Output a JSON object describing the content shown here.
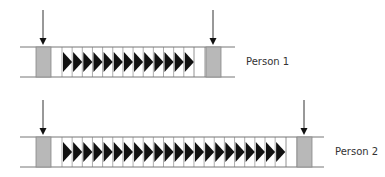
{
  "colors": {
    "line": "#777777",
    "gray_box": "#b8b8b8",
    "gray_box_border": "#888888",
    "triangle": "#111111",
    "arrow": "#333333"
  },
  "rows": [
    {
      "label": "Person 1",
      "top_y": 47,
      "bottom_y": 77,
      "line_start_x": 20,
      "line_end_x": 235,
      "left_box": {
        "x": 36,
        "width": 15
      },
      "triangles": {
        "start_x": 62,
        "count": 13,
        "width": 10.15
      },
      "dividers_x": [
        194,
        205
      ],
      "right_box": {
        "x": 206,
        "width": 15
      },
      "arrows_x": [
        43,
        213
      ],
      "label_x": 246,
      "label_y": 56
    },
    {
      "label": "Person 2",
      "top_y": 137,
      "bottom_y": 167,
      "line_start_x": 20,
      "line_end_x": 324,
      "left_box": {
        "x": 36,
        "width": 15
      },
      "triangles": {
        "start_x": 62,
        "count": 22,
        "width": 10.15
      },
      "dividers_x": [
        286,
        297
      ],
      "right_box": {
        "x": 297,
        "width": 15
      },
      "arrows_x": [
        43,
        304
      ],
      "label_x": 335,
      "label_y": 146
    }
  ]
}
